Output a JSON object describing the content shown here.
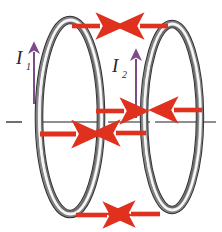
{
  "figure": {
    "background_color": "#ffffff"
  },
  "colors": {
    "force_arrow": "#e0301e",
    "current_arrow": "#7b4b8a",
    "axis_line": "#58585a",
    "ring_dark": "#3d3d3f",
    "ring_mid": "#9a9a9c",
    "ring_light": "#f2f2f2",
    "label_text": "#2b2530"
  },
  "labels": [
    {
      "id": "current-1",
      "symbol": "I",
      "subscript": "1",
      "x": 18,
      "y": 62
    },
    {
      "id": "current-2",
      "symbol": "I",
      "subscript": "2",
      "x": 112,
      "y": 70
    }
  ],
  "loops": [
    {
      "id": "loop-left",
      "name": "left-current-loop",
      "center_x": 70,
      "center_y": 117,
      "radius_x": 31,
      "radius_y": 97,
      "tube_width": 7
    },
    {
      "id": "loop-right",
      "name": "right-current-loop",
      "center_x": 172,
      "center_y": 117,
      "radius_x": 28,
      "radius_y": 93,
      "tube_width": 7
    }
  ],
  "current_arrows": [
    {
      "id": "current-arrow-1",
      "loop": "left",
      "direction": "up",
      "x": 34,
      "y_tail": 104,
      "y_head": 51
    },
    {
      "id": "current-arrow-2",
      "loop": "right",
      "direction": "up",
      "x": 136,
      "y_tail": 118,
      "y_head": 58
    }
  ],
  "force_arrows": [
    {
      "id": "force-top-left",
      "direction": "right",
      "x_tail": 74,
      "x_head": 103,
      "y": 26
    },
    {
      "id": "force-top-right",
      "direction": "left",
      "x_tail": 166,
      "x_head": 137,
      "y": 26
    },
    {
      "id": "force-mid-upper-left",
      "direction": "right",
      "x_tail": 97,
      "x_head": 127,
      "y": 111
    },
    {
      "id": "force-mid-upper-right",
      "direction": "left",
      "x_tail": 201,
      "x_head": 172,
      "y": 110
    },
    {
      "id": "force-mid-lower-left",
      "direction": "right",
      "x_tail": 41,
      "x_head": 78,
      "y": 134
    },
    {
      "id": "force-mid-lower-right",
      "direction": "left",
      "x_tail": 145,
      "x_head": 114,
      "y": 133
    },
    {
      "id": "force-bottom-left",
      "direction": "right",
      "x_tail": 78,
      "x_head": 110,
      "y": 215
    },
    {
      "id": "force-bottom-right",
      "direction": "left",
      "x_tail": 158,
      "x_head": 128,
      "y": 214
    }
  ],
  "axis": {
    "id": "symmetry-axis",
    "y": 122,
    "segments": [
      {
        "x1": 6,
        "x2": 22
      },
      {
        "x1": 37,
        "x2": 101
      },
      {
        "x1": 108,
        "x2": 150
      },
      {
        "x1": 155,
        "x2": 216
      }
    ]
  }
}
